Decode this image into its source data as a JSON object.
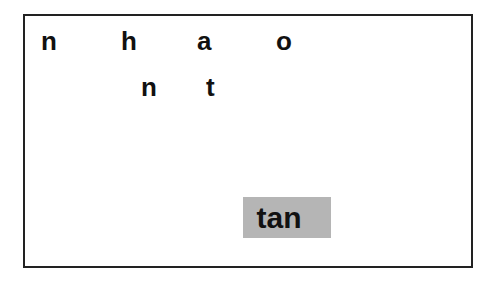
{
  "board": {
    "letters": [
      {
        "char": "n",
        "row": 1,
        "x": 41,
        "y": 26
      },
      {
        "char": "h",
        "row": 1,
        "x": 121,
        "y": 26
      },
      {
        "char": "a",
        "row": 1,
        "x": 197,
        "y": 26
      },
      {
        "char": "o",
        "row": 1,
        "x": 276,
        "y": 26
      },
      {
        "char": "n",
        "row": 2,
        "x": 141,
        "y": 72
      },
      {
        "char": "t",
        "row": 2,
        "x": 205,
        "y": 72
      }
    ],
    "word": "tan",
    "colors": {
      "border": "#222222",
      "tile_background": "#b5b5b5",
      "text": "#111111"
    }
  }
}
